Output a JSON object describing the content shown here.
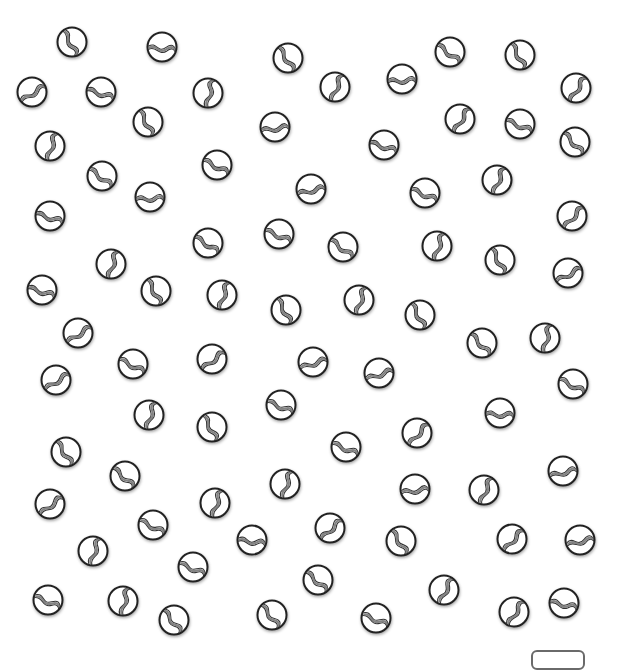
{
  "scene": {
    "description": "Scattered glass marbles with swirl patterns on white background",
    "background": "#ffffff",
    "marble_outline_color": "#222222",
    "marble_swirl_color": "#777777",
    "marble_shadow_color": "#555555",
    "marble_count": 80
  },
  "marbles": [
    {
      "x": 72,
      "y": 42,
      "r": 80
    },
    {
      "x": 162,
      "y": 47,
      "r": 20
    },
    {
      "x": 288,
      "y": 58,
      "r": 75
    },
    {
      "x": 450,
      "y": 52,
      "r": 55
    },
    {
      "x": 520,
      "y": 55,
      "r": 80
    },
    {
      "x": 32,
      "y": 92,
      "r": -15
    },
    {
      "x": 101,
      "y": 92,
      "r": 35
    },
    {
      "x": 208,
      "y": 93,
      "r": -60
    },
    {
      "x": 335,
      "y": 87,
      "r": -50
    },
    {
      "x": 402,
      "y": 79,
      "r": 15
    },
    {
      "x": 576,
      "y": 88,
      "r": -40
    },
    {
      "x": 148,
      "y": 122,
      "r": 80
    },
    {
      "x": 275,
      "y": 127,
      "r": 10
    },
    {
      "x": 460,
      "y": 119,
      "r": -40
    },
    {
      "x": 520,
      "y": 124,
      "r": 40
    },
    {
      "x": 50,
      "y": 146,
      "r": -55
    },
    {
      "x": 384,
      "y": 145,
      "r": 35
    },
    {
      "x": 575,
      "y": 142,
      "r": 65
    },
    {
      "x": 102,
      "y": 176,
      "r": 55
    },
    {
      "x": 217,
      "y": 165,
      "r": 45
    },
    {
      "x": 150,
      "y": 197,
      "r": 15
    },
    {
      "x": 311,
      "y": 189,
      "r": 5
    },
    {
      "x": 425,
      "y": 193,
      "r": 40
    },
    {
      "x": 497,
      "y": 180,
      "r": -50
    },
    {
      "x": 50,
      "y": 216,
      "r": 35
    },
    {
      "x": 572,
      "y": 216,
      "r": -30
    },
    {
      "x": 279,
      "y": 234,
      "r": 40
    },
    {
      "x": 208,
      "y": 243,
      "r": 50
    },
    {
      "x": 343,
      "y": 247,
      "r": 55
    },
    {
      "x": 437,
      "y": 246,
      "r": -55
    },
    {
      "x": 500,
      "y": 260,
      "r": 80
    },
    {
      "x": 111,
      "y": 264,
      "r": -55
    },
    {
      "x": 568,
      "y": 273,
      "r": -10
    },
    {
      "x": 42,
      "y": 290,
      "r": 35
    },
    {
      "x": 156,
      "y": 291,
      "r": 80
    },
    {
      "x": 222,
      "y": 295,
      "r": -55
    },
    {
      "x": 286,
      "y": 310,
      "r": 80
    },
    {
      "x": 359,
      "y": 300,
      "r": -55
    },
    {
      "x": 420,
      "y": 315,
      "r": 80
    },
    {
      "x": 78,
      "y": 333,
      "r": -15
    },
    {
      "x": 482,
      "y": 343,
      "r": 65
    },
    {
      "x": 545,
      "y": 338,
      "r": -60
    },
    {
      "x": 133,
      "y": 364,
      "r": 45
    },
    {
      "x": 212,
      "y": 359,
      "r": -20
    },
    {
      "x": 313,
      "y": 362,
      "r": 0
    },
    {
      "x": 379,
      "y": 373,
      "r": 0
    },
    {
      "x": 56,
      "y": 380,
      "r": -15
    },
    {
      "x": 573,
      "y": 384,
      "r": 45
    },
    {
      "x": 149,
      "y": 415,
      "r": -55
    },
    {
      "x": 212,
      "y": 427,
      "r": 80
    },
    {
      "x": 281,
      "y": 405,
      "r": 40
    },
    {
      "x": 500,
      "y": 413,
      "r": 20
    },
    {
      "x": 346,
      "y": 447,
      "r": 40
    },
    {
      "x": 417,
      "y": 433,
      "r": -30
    },
    {
      "x": 66,
      "y": 452,
      "r": 75
    },
    {
      "x": 125,
      "y": 476,
      "r": 60
    },
    {
      "x": 285,
      "y": 484,
      "r": -55
    },
    {
      "x": 563,
      "y": 471,
      "r": 5
    },
    {
      "x": 415,
      "y": 489,
      "r": 10
    },
    {
      "x": 484,
      "y": 490,
      "r": -50
    },
    {
      "x": 50,
      "y": 504,
      "r": -20
    },
    {
      "x": 215,
      "y": 503,
      "r": -55
    },
    {
      "x": 153,
      "y": 525,
      "r": 45
    },
    {
      "x": 330,
      "y": 528,
      "r": -25
    },
    {
      "x": 401,
      "y": 541,
      "r": 75
    },
    {
      "x": 512,
      "y": 539,
      "r": -30
    },
    {
      "x": 580,
      "y": 540,
      "r": 5
    },
    {
      "x": 252,
      "y": 540,
      "r": 25
    },
    {
      "x": 93,
      "y": 551,
      "r": -55
    },
    {
      "x": 193,
      "y": 567,
      "r": 40
    },
    {
      "x": 318,
      "y": 580,
      "r": 60
    },
    {
      "x": 444,
      "y": 590,
      "r": -45
    },
    {
      "x": 48,
      "y": 600,
      "r": 40
    },
    {
      "x": 123,
      "y": 601,
      "r": -60
    },
    {
      "x": 174,
      "y": 620,
      "r": 70
    },
    {
      "x": 272,
      "y": 615,
      "r": 70
    },
    {
      "x": 376,
      "y": 618,
      "r": 40
    },
    {
      "x": 514,
      "y": 612,
      "r": -40
    },
    {
      "x": 564,
      "y": 603,
      "r": 30
    }
  ],
  "answer_box": {
    "value": ""
  }
}
